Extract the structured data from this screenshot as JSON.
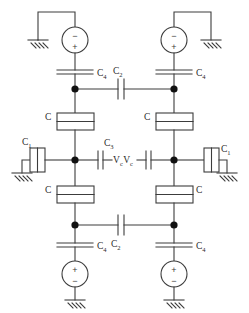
{
  "figure": {
    "type": "circuit-schematic",
    "width": 249,
    "height": 313,
    "background_color": "#ffffff",
    "wire_color": "#3c3c3c",
    "node_color": "#111111",
    "label_color": "#2a2a2a"
  },
  "labels": {
    "c1": "C",
    "c1_sub": "1",
    "c2": "C",
    "c2_sub": "2",
    "c3": "C",
    "c3_sub": "3",
    "c4": "C",
    "c4_sub": "4",
    "c": "C",
    "vc": "V",
    "vc_sub": "c"
  },
  "polarity": {
    "plus": "+",
    "minus": "−"
  },
  "components": [
    {
      "id": "src-top-left",
      "name": "voltage-source-top-left",
      "kind": "voltage-source",
      "cx": 75,
      "cy": 40,
      "r": 13,
      "top_terminal": "−",
      "bottom_terminal": "+"
    },
    {
      "id": "src-top-right",
      "name": "voltage-source-top-right",
      "kind": "voltage-source",
      "cx": 174,
      "cy": 40,
      "r": 13,
      "top_terminal": "−",
      "bottom_terminal": "+"
    },
    {
      "id": "src-bot-left",
      "name": "voltage-source-bottom-left",
      "kind": "voltage-source",
      "cx": 75,
      "cy": 274,
      "r": 13,
      "top_terminal": "+",
      "bottom_terminal": "−"
    },
    {
      "id": "src-bot-right",
      "name": "voltage-source-bottom-right",
      "kind": "voltage-source",
      "cx": 174,
      "cy": 274,
      "r": 13,
      "top_terminal": "+",
      "bottom_terminal": "−"
    },
    {
      "id": "c4-tl",
      "name": "capacitor-c4-top-left",
      "kind": "capacitor-horizontal",
      "label": "C4"
    },
    {
      "id": "c4-tr",
      "name": "capacitor-c4-top-right",
      "kind": "capacitor-horizontal",
      "label": "C4"
    },
    {
      "id": "c4-bl",
      "name": "capacitor-c4-bottom-left",
      "kind": "capacitor-horizontal",
      "label": "C4"
    },
    {
      "id": "c4-br",
      "name": "capacitor-c4-bottom-right",
      "kind": "capacitor-horizontal",
      "label": "C4"
    },
    {
      "id": "c2-top",
      "name": "capacitor-c2-top",
      "kind": "capacitor-vertical",
      "label": "C2"
    },
    {
      "id": "c2-bot",
      "name": "capacitor-c2-bottom",
      "kind": "capacitor-vertical",
      "label": "C2"
    },
    {
      "id": "c3-left",
      "name": "capacitor-c3-left",
      "kind": "capacitor-vertical",
      "label": "C3"
    },
    {
      "id": "c3-right",
      "name": "capacitor-c3-right",
      "kind": "capacitor-vertical",
      "label": "C3"
    },
    {
      "id": "c1-left",
      "name": "element-c1-left",
      "kind": "box-element",
      "label": "C1"
    },
    {
      "id": "c1-right",
      "name": "element-c1-right",
      "kind": "box-element",
      "label": "C1"
    },
    {
      "id": "c-tl",
      "name": "element-c-top-left",
      "kind": "split-box-element",
      "label": "C"
    },
    {
      "id": "c-tr",
      "name": "element-c-top-right",
      "kind": "split-box-element",
      "label": "C"
    },
    {
      "id": "c-bl",
      "name": "element-c-bottom-left",
      "kind": "split-box-element",
      "label": "C"
    },
    {
      "id": "c-br",
      "name": "element-c-bottom-right",
      "kind": "split-box-element",
      "label": "C"
    }
  ],
  "grounds": [
    {
      "name": "ground-top-left",
      "x": 38,
      "y": 40
    },
    {
      "name": "ground-top-right",
      "x": 211,
      "y": 40
    },
    {
      "name": "ground-mid-left",
      "x": 22,
      "y": 173
    },
    {
      "name": "ground-mid-right",
      "x": 227,
      "y": 173
    },
    {
      "name": "ground-bottom-left",
      "x": 75,
      "y": 300
    },
    {
      "name": "ground-bottom-right",
      "x": 174,
      "y": 300
    }
  ],
  "nodes": [
    {
      "name": "node-top-left",
      "x": 75,
      "y": 89
    },
    {
      "name": "node-top-right",
      "x": 174,
      "y": 89
    },
    {
      "name": "node-mid-left",
      "x": 75,
      "y": 160
    },
    {
      "name": "node-mid-right",
      "x": 174,
      "y": 160
    },
    {
      "name": "node-low-left",
      "x": 75,
      "y": 225
    },
    {
      "name": "node-low-right",
      "x": 174,
      "y": 225
    }
  ]
}
